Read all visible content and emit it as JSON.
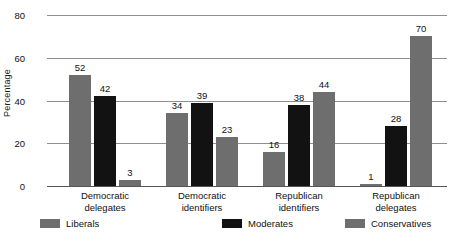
{
  "chart_data": {
    "type": "bar",
    "title": "",
    "xlabel": "",
    "ylabel": "Percentage",
    "ylim": [
      0,
      80
    ],
    "yticks": [
      0,
      20,
      40,
      60,
      80
    ],
    "ytick_labels": [
      "0",
      "20",
      "40",
      "60",
      "80"
    ],
    "grid": true,
    "legend_position": "bottom",
    "categories": [
      "Democratic delegates",
      "Democratic identifiers",
      "Republican identifiers",
      "Republican delegates"
    ],
    "category_lines": [
      [
        "Democratic",
        "delegates"
      ],
      [
        "Democratic",
        "identifiers"
      ],
      [
        "Republican",
        "identifiers"
      ],
      [
        "Republican",
        "delegates"
      ]
    ],
    "series": [
      {
        "name": "Liberals",
        "color": "#6e6e6e",
        "values": [
          52,
          34,
          16,
          1
        ]
      },
      {
        "name": "Moderates",
        "color": "#121212",
        "values": [
          42,
          39,
          38,
          28
        ]
      },
      {
        "name": "Conservatives",
        "color": "#6e6e6e",
        "values": [
          3,
          23,
          44,
          70
        ]
      }
    ],
    "value_labels": [
      [
        "52",
        "42",
        "3"
      ],
      [
        "34",
        "39",
        "23"
      ],
      [
        "16",
        "38",
        "44"
      ],
      [
        "1",
        "28",
        "70"
      ]
    ]
  },
  "legend": {
    "items": [
      {
        "label": "Liberals"
      },
      {
        "label": "Moderates"
      },
      {
        "label": "Conservatives"
      }
    ]
  },
  "axis": {
    "y_title": "Percentage"
  }
}
